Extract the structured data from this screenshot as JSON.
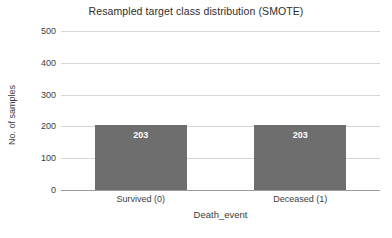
{
  "chart_data": {
    "type": "bar",
    "title": "Resampled target class distribution (SMOTE)",
    "xlabel": "Death_event",
    "ylabel": "No. of samples",
    "categories": [
      "Survived (0)",
      "Deceased (1)"
    ],
    "values": [
      203,
      203
    ],
    "data_labels": [
      "203",
      "203"
    ],
    "ylim": [
      0,
      500
    ],
    "yticks": [
      0,
      100,
      200,
      300,
      400,
      500
    ],
    "ytick_labels": [
      "0",
      "100",
      "200",
      "300",
      "400",
      "500"
    ],
    "grid": true,
    "grid_axis": "y",
    "legend": false,
    "bar_color": "#6e6e6e",
    "gridline_color": "#d6d6d6",
    "axis_color": "#9a9a9a",
    "background_color": "#ffffff",
    "data_label_color": "#ffffff"
  }
}
